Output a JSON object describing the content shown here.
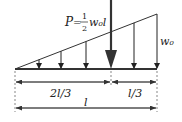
{
  "diagram": {
    "load_label_P": "P",
    "load_label_eq": "=",
    "load_frac_num": "1",
    "load_frac_den": "2",
    "load_label_w0l": "w₀l",
    "max_intensity_label": "w₀",
    "dim_left_label": "2l/3",
    "dim_right_label": "l/3",
    "dim_total_label": "l",
    "colors": {
      "line": "#222222",
      "resultant": "#333333"
    }
  }
}
